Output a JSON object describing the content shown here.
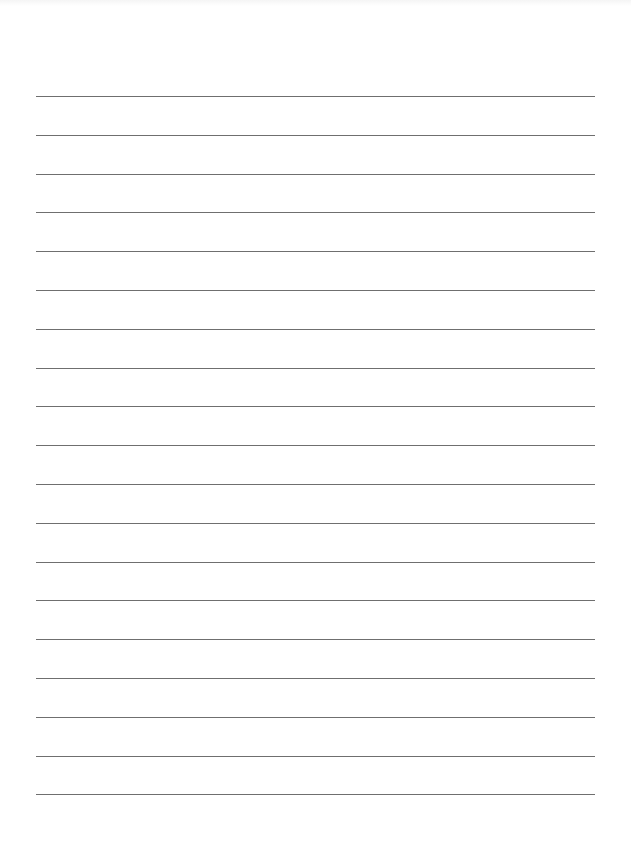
{
  "page": {
    "type": "lined-paper",
    "background_color": "#ffffff",
    "line_color": "#6f6f6f",
    "line_count": 19,
    "line_left_px": 36,
    "line_right_px": 595,
    "first_line_y_px": 96,
    "line_spacing_px": 38.8,
    "text_content": ""
  }
}
